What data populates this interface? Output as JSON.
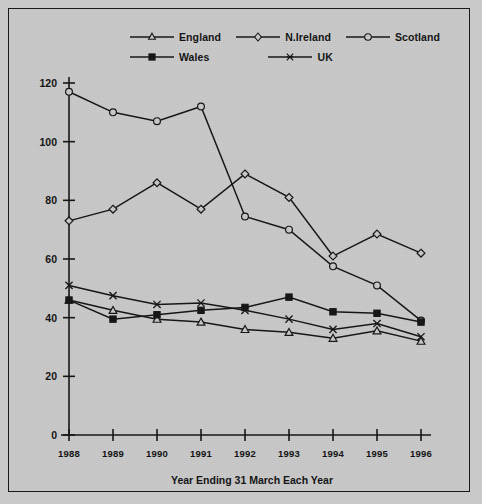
{
  "chart_data": {
    "type": "line",
    "title": "",
    "xlabel": "Year Ending 31 March Each Year",
    "ylabel": "",
    "xlim": [
      1988,
      1996
    ],
    "ylim": [
      0,
      120
    ],
    "ytick_step": 20,
    "grid": false,
    "legend_position": "top-center",
    "categories": [
      "1988",
      "1989",
      "1990",
      "1991",
      "1992",
      "1993",
      "1994",
      "1995",
      "1996"
    ],
    "x": [
      1988,
      1989,
      1990,
      1991,
      1992,
      1993,
      1994,
      1995,
      1996
    ],
    "yticks": [
      "0",
      "20",
      "40",
      "60",
      "80",
      "100",
      "120"
    ],
    "series": [
      {
        "name": "England",
        "marker": "triangle-open",
        "values": [
          46,
          42.5,
          39.5,
          38.5,
          36,
          35,
          33,
          35.5,
          32
        ]
      },
      {
        "name": "N.Ireland",
        "marker": "diamond-open",
        "values": [
          73,
          77,
          86,
          77,
          89,
          81,
          61,
          68.5,
          62
        ]
      },
      {
        "name": "Scotland",
        "marker": "circle-open",
        "values": [
          117,
          110,
          107,
          112,
          74.5,
          70,
          57.5,
          51,
          39
        ]
      },
      {
        "name": "Wales",
        "marker": "square-solid",
        "values": [
          46,
          39.5,
          41,
          42.5,
          43.5,
          47,
          42,
          41.5,
          38.5
        ]
      },
      {
        "name": "UK",
        "marker": "x-cross",
        "values": [
          51,
          47.5,
          44.5,
          45,
          42.5,
          39.5,
          36,
          38,
          33.5
        ]
      }
    ]
  },
  "legend": {
    "rows": [
      [
        "England",
        "N.Ireland",
        "Scotland"
      ],
      [
        "Wales",
        "UK"
      ]
    ]
  },
  "colors": {
    "background": "#c9c9c9",
    "ink": "#141414",
    "border": "#1a1a1a"
  }
}
